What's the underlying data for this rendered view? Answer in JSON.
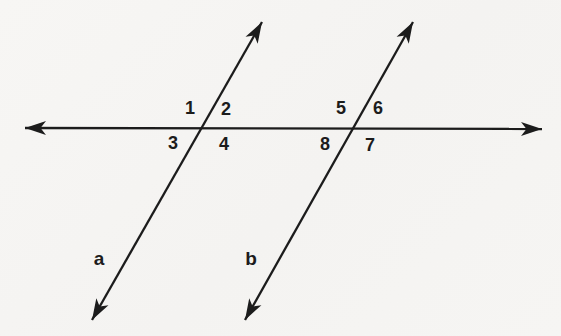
{
  "background_color": "#f5f4f2",
  "line_color": "#1c1c1c",
  "diagram": {
    "type": "parallel-lines-cut-by-transversal",
    "canvas": {
      "width": 561,
      "height": 336
    },
    "lines": [
      {
        "id": "transversal-line",
        "x1": 25,
        "y1": 128,
        "x2": 542,
        "y2": 129,
        "arrow_start": true,
        "arrow_end": true
      },
      {
        "id": "line-a",
        "x1": 92,
        "y1": 320,
        "x2": 262,
        "y2": 22,
        "arrow_start": true,
        "arrow_end": true
      },
      {
        "id": "line-b",
        "x1": 245,
        "y1": 320,
        "x2": 413,
        "y2": 22,
        "arrow_start": true,
        "arrow_end": true
      }
    ],
    "line_labels": [
      {
        "text": "a",
        "x": 99,
        "y": 265
      },
      {
        "text": "b",
        "x": 251,
        "y": 265
      }
    ],
    "angle_labels": [
      {
        "text": "1",
        "x": 190,
        "y": 114
      },
      {
        "text": "2",
        "x": 226,
        "y": 115
      },
      {
        "text": "3",
        "x": 173,
        "y": 149
      },
      {
        "text": "4",
        "x": 224,
        "y": 150
      },
      {
        "text": "5",
        "x": 341,
        "y": 114
      },
      {
        "text": "6",
        "x": 378,
        "y": 114
      },
      {
        "text": "8",
        "x": 325,
        "y": 150
      },
      {
        "text": "7",
        "x": 370,
        "y": 151
      }
    ],
    "intersections": [
      {
        "lines": "line-a × transversal-line",
        "x": 203,
        "y": 127
      },
      {
        "lines": "line-b × transversal-line",
        "x": 355,
        "y": 128
      }
    ]
  }
}
